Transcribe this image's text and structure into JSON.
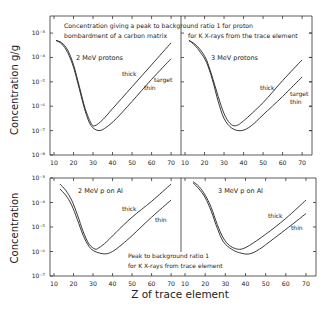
{
  "figure": {
    "xlabel": "Z of trace element",
    "top_ylabel": "Concentration  g/g",
    "bottom_ylabel": "Concentration",
    "top_caption_line1": "Concentration giving a peak to background ratio 1 for proton",
    "top_caption_line2a": "bombardment of a carbon matrix",
    "top_caption_line2b": "for K X-rays from the trace element",
    "bottom_caption_line1": "Peak to background ratio 1",
    "bottom_caption_line2": "for K X-rays from trace element"
  },
  "chart_data": [
    {
      "type": "line",
      "panel": "top-left",
      "title": "2 MeV protons",
      "xlabel": "Z of trace element",
      "ylabel": "Concentration g/g",
      "xlim": [
        10,
        72
      ],
      "ylim_log10": [
        -8,
        -2.3
      ],
      "x_ticks": [
        10,
        20,
        30,
        40,
        50,
        60,
        70
      ],
      "y_ticks": [
        "10^-3",
        "10^-4",
        "10^-5",
        "10^-6",
        "10^-7",
        "10^-8"
      ],
      "annotations": [
        "thick",
        "target",
        "thin"
      ],
      "series": [
        {
          "name": "thick target",
          "x": [
            11,
            14,
            17,
            20,
            23,
            26,
            29,
            31,
            35,
            40,
            50,
            60,
            70
          ],
          "log10y": [
            -3.3,
            -3.4,
            -3.7,
            -4.3,
            -5.2,
            -6.1,
            -6.7,
            -6.8,
            -6.55,
            -6.1,
            -5.2,
            -4.3,
            -3.4
          ]
        },
        {
          "name": "thin target",
          "x": [
            11,
            14,
            17,
            20,
            23,
            26,
            29,
            33,
            37,
            42,
            50,
            60,
            70
          ],
          "log10y": [
            -3.3,
            -3.45,
            -3.8,
            -4.4,
            -5.3,
            -6.2,
            -6.8,
            -7.0,
            -6.85,
            -6.5,
            -5.8,
            -4.9,
            -4.05
          ]
        }
      ]
    },
    {
      "type": "line",
      "panel": "top-right",
      "title": "3 MeV protons",
      "xlabel": "Z of trace element",
      "ylabel": "Concentration g/g",
      "xlim": [
        10,
        72
      ],
      "ylim_log10": [
        -8,
        -2.3
      ],
      "x_ticks": [
        10,
        20,
        30,
        40,
        50,
        60,
        70
      ],
      "annotations": [
        "thick",
        "target",
        "thin"
      ],
      "series": [
        {
          "name": "thick target",
          "x": [
            12,
            15,
            18,
            21,
            24,
            27,
            30,
            33,
            36,
            40,
            50,
            60,
            70
          ],
          "log10y": [
            -3.3,
            -3.45,
            -3.7,
            -4.1,
            -4.8,
            -5.6,
            -6.3,
            -6.7,
            -6.8,
            -6.6,
            -5.85,
            -4.95,
            -4.1
          ]
        },
        {
          "name": "thin target",
          "x": [
            12,
            15,
            18,
            21,
            24,
            27,
            30,
            34,
            39,
            44,
            50,
            60,
            70
          ],
          "log10y": [
            -3.3,
            -3.5,
            -3.8,
            -4.2,
            -4.9,
            -5.8,
            -6.5,
            -6.9,
            -7.0,
            -6.8,
            -6.35,
            -5.6,
            -4.8
          ]
        }
      ]
    },
    {
      "type": "line",
      "panel": "bottom-left",
      "title": "2 MeV p on Al",
      "xlabel": "Z of trace element",
      "ylabel": "Concentration",
      "xlim": [
        10,
        72
      ],
      "ylim_log10": [
        -7,
        -3
      ],
      "x_ticks": [
        10,
        20,
        30,
        40,
        50,
        60,
        70
      ],
      "y_ticks": [
        "10^-3",
        "10^-4",
        "10^-5",
        "10^-6",
        "10^-7"
      ],
      "annotations": [
        "thick",
        "thin"
      ],
      "series": [
        {
          "name": "thick",
          "x": [
            13,
            16,
            19,
            22,
            25,
            28,
            31,
            33,
            37,
            42,
            50,
            60,
            70
          ],
          "log10y": [
            -3.25,
            -3.5,
            -3.9,
            -4.5,
            -5.2,
            -5.7,
            -5.9,
            -5.85,
            -5.6,
            -5.2,
            -4.6,
            -3.95,
            -3.25
          ]
        },
        {
          "name": "thin",
          "x": [
            13,
            16,
            19,
            22,
            25,
            28,
            31,
            36,
            40,
            45,
            50,
            60,
            70
          ],
          "log10y": [
            -3.45,
            -3.7,
            -4.1,
            -4.7,
            -5.35,
            -5.8,
            -6.0,
            -6.1,
            -6.0,
            -5.7,
            -5.35,
            -4.6,
            -3.9
          ]
        }
      ]
    },
    {
      "type": "line",
      "panel": "bottom-right",
      "title": "3 MeV p on Al",
      "xlabel": "Z of trace element",
      "ylabel": "Concentration",
      "xlim": [
        10,
        72
      ],
      "ylim_log10": [
        -7,
        -3
      ],
      "x_ticks": [
        10,
        20,
        30,
        40,
        50,
        60,
        70
      ],
      "annotations": [
        "thick",
        "thin"
      ],
      "series": [
        {
          "name": "thick",
          "x": [
            14,
            17,
            20,
            23,
            26,
            29,
            32,
            35,
            38,
            42,
            50,
            60,
            70
          ],
          "log10y": [
            -3.15,
            -3.35,
            -3.7,
            -4.2,
            -4.9,
            -5.45,
            -5.75,
            -5.88,
            -5.9,
            -5.75,
            -5.3,
            -4.65,
            -3.9
          ]
        },
        {
          "name": "thin",
          "x": [
            14,
            17,
            20,
            23,
            26,
            29,
            33,
            37,
            42,
            47,
            52,
            60,
            70
          ],
          "log10y": [
            -3.2,
            -3.45,
            -3.8,
            -4.35,
            -5.05,
            -5.6,
            -5.9,
            -6.05,
            -6.1,
            -5.9,
            -5.6,
            -5.1,
            -4.45
          ]
        }
      ]
    }
  ]
}
